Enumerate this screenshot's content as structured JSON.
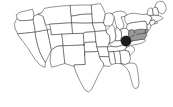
{
  "figure": {
    "background_color": "#ffffff",
    "width": 173,
    "height": 107
  },
  "map": {
    "name": "contiguous-united-states",
    "projection_style": "simplified outline",
    "outline_color": "#3a3a3a",
    "state_fill_color": "#ffffff",
    "highlight_fill_color": "#9a9a9a",
    "marker_color": "#1c1c1c",
    "highlighted_states": [
      "West Virginia",
      "Virginia",
      "Maryland",
      "Delaware"
    ],
    "marker": {
      "name": "location-marker",
      "shape": "filled-circle",
      "region": "Ohio / West Virginia border",
      "x": 126,
      "y": 41,
      "radius": 5.2
    },
    "states": [
      {
        "code": "WA",
        "name": "Washington",
        "highlighted": false,
        "d": "M16.5,14.5 L20.0,12.2 L26.5,10.6 L32.5,9.2 L33.4,12.0 L34.0,15.8 L33.2,19.4 L31.0,20.2 L25.0,20.6 L19.2,20.6 L17.4,18.6 Z"
      },
      {
        "code": "OR",
        "name": "Oregon",
        "highlighted": false,
        "d": "M17.4,18.6 L19.2,20.6 L25.0,20.6 L31.0,20.2 L33.2,19.4 L34.6,27.5 L35.3,32.0 L25.2,33.2 L17.8,33.8 L15.2,29.0 L14.4,24.0 Z"
      },
      {
        "code": "CA",
        "name": "California",
        "highlighted": false,
        "d": "M17.8,33.8 L25.2,33.2 L35.3,32.0 L36.0,38.0 L37.6,45.0 L39.8,52.0 L42.8,58.0 L45.4,62.5 L45.0,67.5 L40.0,65.0 L35.5,60.0 L31.5,54.0 L27.5,47.5 L23.0,41.5 L19.8,37.5 Z"
      },
      {
        "code": "NV",
        "name": "Nevada",
        "highlighted": false,
        "d": "M35.3,32.0 L44.6,30.2 L47.5,29.8 L49.6,41.0 L51.4,50.0 L45.4,62.5 L42.8,58.0 L39.8,52.0 L37.6,45.0 L36.0,38.0 Z"
      },
      {
        "code": "ID",
        "name": "Idaho",
        "highlighted": false,
        "d": "M33.2,19.4 L34.0,15.8 L38.0,14.2 L41.6,13.0 L43.2,16.6 L44.6,21.0 L45.6,25.2 L47.5,29.8 L44.6,30.2 L35.3,32.0 L34.6,27.5 Z"
      },
      {
        "code": "MT",
        "name": "Montana",
        "highlighted": false,
        "d": "M38.0,14.2 L41.6,13.0 L44.2,8.4 L52.0,7.0 L62.0,6.0 L70.5,5.4 L71.4,16.2 L72.0,22.8 L61.0,23.4 L50.0,24.2 L45.6,25.2 L44.6,21.0 L43.2,16.6 Z"
      },
      {
        "code": "WY",
        "name": "Wyoming",
        "highlighted": false,
        "d": "M50.0,24.2 L61.0,23.4 L72.0,22.8 L72.8,33.6 L62.0,34.2 L51.2,34.8 L50.6,29.0 Z"
      },
      {
        "code": "UT",
        "name": "Utah",
        "highlighted": false,
        "d": "M47.5,29.8 L50.6,29.0 L51.2,34.8 L62.0,34.2 L62.6,40.0 L63.2,45.8 L57.0,46.2 L51.4,50.0 L49.6,41.0 Z"
      },
      {
        "code": "CO",
        "name": "Colorado",
        "highlighted": false,
        "d": "M62.0,34.2 L72.8,33.6 L83.6,33.2 L84.2,45.0 L73.6,45.4 L63.2,45.8 L62.6,40.0 Z"
      },
      {
        "code": "AZ",
        "name": "Arizona",
        "highlighted": false,
        "d": "M51.4,50.0 L57.0,46.2 L63.2,45.8 L64.0,55.0 L64.8,63.5 L57.0,65.8 L51.6,67.2 L50.2,62.0 Z"
      },
      {
        "code": "NM",
        "name": "New Mexico",
        "highlighted": false,
        "d": "M63.2,45.8 L73.6,45.4 L84.2,45.0 L84.8,56.0 L85.3,64.5 L76.5,64.8 L74.2,64.9 L74.2,66.5 L64.8,63.5 L64.0,55.0 Z"
      },
      {
        "code": "ND",
        "name": "North Dakota",
        "highlighted": false,
        "d": "M70.5,5.4 L81.0,5.0 L91.5,5.0 L92.0,14.0 L81.6,14.4 L71.4,16.2 Z"
      },
      {
        "code": "SD",
        "name": "South Dakota",
        "highlighted": false,
        "d": "M71.4,16.2 L81.6,14.4 L92.0,14.0 L92.6,23.0 L82.4,23.2 L72.0,22.8 Z"
      },
      {
        "code": "NE",
        "name": "Nebraska",
        "highlighted": false,
        "d": "M72.0,22.8 L82.4,23.2 L92.6,23.0 L93.8,28.0 L95.2,31.6 L84.6,32.4 L83.6,33.2 L72.8,33.6 Z"
      },
      {
        "code": "KS",
        "name": "Kansas",
        "highlighted": false,
        "d": "M83.6,33.2 L84.6,32.4 L95.2,31.6 L96.0,42.0 L85.0,42.4 L84.2,45.0 Z"
      },
      {
        "code": "OK",
        "name": "Oklahoma",
        "highlighted": false,
        "d": "M84.2,45.0 L85.0,42.4 L96.0,42.0 L97.0,47.0 L98.2,51.5 L88.0,52.0 L84.8,51.8 L84.8,56.0 L84.2,45.0 Z"
      },
      {
        "code": "TX",
        "name": "Texas",
        "highlighted": false,
        "d": "M74.2,66.5 L74.2,64.9 L76.5,64.8 L85.3,64.5 L84.8,56.0 L84.8,51.8 L88.0,52.0 L98.2,51.5 L99.6,56.5 L101.0,60.0 L103.2,62.5 L104.0,66.0 L102.0,68.5 L100.0,72.0 L97.0,78.0 L94.0,84.5 L91.5,89.5 L88.5,92.0 L85.0,90.0 L82.0,85.0 L79.0,79.0 L76.2,72.5 Z"
      },
      {
        "code": "MN",
        "name": "Minnesota",
        "highlighted": false,
        "d": "M91.5,5.0 L96.0,4.2 L100.5,3.6 L102.5,7.0 L104.0,10.5 L105.4,14.0 L104.4,18.8 L103.6,22.6 L93.2,23.0 L92.6,23.0 L92.0,14.0 Z"
      },
      {
        "code": "IA",
        "name": "Iowa",
        "highlighted": false,
        "d": "M92.6,23.0 L93.2,23.0 L103.6,22.6 L105.4,26.0 L106.2,30.6 L96.2,31.4 L95.2,31.6 L93.8,28.0 Z"
      },
      {
        "code": "MO",
        "name": "Missouri",
        "highlighted": false,
        "d": "M95.2,31.6 L96.2,31.4 L106.2,30.6 L107.2,33.6 L109.6,35.4 L110.2,40.0 L109.0,43.6 L107.6,46.8 L97.0,47.0 L96.0,42.0 Z"
      },
      {
        "code": "AR",
        "name": "Arkansas",
        "highlighted": false,
        "d": "M97.0,47.0 L107.6,46.8 L108.6,52.0 L109.2,56.8 L99.6,56.5 L98.2,51.5 Z"
      },
      {
        "code": "LA",
        "name": "Louisiana",
        "highlighted": false,
        "d": "M99.6,56.5 L109.2,56.8 L110.0,62.0 L111.6,64.5 L109.0,66.5 L106.0,66.0 L104.0,66.0 L103.2,62.5 L101.0,60.0 Z"
      },
      {
        "code": "WI",
        "name": "Wisconsin",
        "highlighted": false,
        "d": "M103.6,22.6 L104.4,18.8 L105.4,14.0 L108.6,12.8 L112.0,13.6 L114.2,16.8 L113.6,21.0 L112.4,24.4 L110.6,25.8 L105.4,26.0 Z"
      },
      {
        "code": "IL",
        "name": "Illinois",
        "highlighted": false,
        "d": "M106.2,30.6 L110.6,25.8 L112.4,24.4 L114.0,27.0 L115.2,31.5 L116.0,36.5 L115.2,40.5 L112.4,42.5 L109.0,43.6 L110.2,40.0 L109.6,35.4 L107.2,33.6 Z"
      },
      {
        "code": "MI",
        "name": "Michigan",
        "highlighted": false,
        "d": "M112.0,13.6 L116.0,11.6 L121.0,11.0 L125.0,12.2 L127.0,15.0 L124.8,16.4 L121.0,17.0 L122.6,21.0 L124.0,25.2 L123.0,28.6 L119.6,29.6 L116.6,27.0 L115.4,23.0 L114.2,16.8 Z"
      },
      {
        "code": "IN",
        "name": "Indiana",
        "highlighted": false,
        "d": "M115.2,31.5 L116.6,27.0 L119.6,29.6 L121.2,31.0 L121.6,36.0 L121.0,40.5 L116.0,41.0 L115.2,40.5 L116.0,36.5 Z"
      },
      {
        "code": "OH",
        "name": "Ohio",
        "highlighted": false,
        "d": "M119.6,29.6 L123.0,28.6 L126.6,28.0 L129.0,30.6 L128.6,35.0 L127.0,38.6 L124.4,40.8 L121.0,40.5 L121.6,36.0 L121.2,31.0 Z"
      },
      {
        "code": "KY",
        "name": "Kentucky",
        "highlighted": false,
        "d": "M112.4,42.5 L115.2,40.5 L116.0,41.0 L121.0,40.5 L124.4,40.8 L126.2,43.0 L124.0,44.6 L120.0,46.0 L115.6,47.0 L112.0,46.4 L109.0,43.6 Z"
      },
      {
        "code": "TN",
        "name": "Tennessee",
        "highlighted": false,
        "d": "M107.6,46.8 L112.0,46.4 L115.6,47.0 L120.0,46.0 L124.0,44.6 L126.6,47.0 L125.0,50.0 L120.0,51.0 L114.0,51.6 L108.6,52.0 Z"
      },
      {
        "code": "MS",
        "name": "Mississippi",
        "highlighted": false,
        "d": "M109.2,56.8 L108.6,52.0 L114.0,51.6 L115.0,58.0 L115.6,63.5 L111.6,64.5 L110.0,62.0 Z"
      },
      {
        "code": "AL",
        "name": "Alabama",
        "highlighted": false,
        "d": "M114.0,51.6 L120.0,51.0 L120.6,57.0 L121.2,63.6 L115.6,63.5 L115.0,58.0 Z"
      },
      {
        "code": "GA",
        "name": "Georgia",
        "highlighted": false,
        "d": "M120.0,51.0 L125.0,50.0 L129.0,51.6 L130.0,55.5 L130.4,60.0 L128.6,63.2 L125.0,64.6 L121.2,63.6 L120.6,57.0 Z"
      },
      {
        "code": "FL",
        "name": "Florida",
        "highlighted": false,
        "d": "M121.2,63.6 L125.0,64.6 L128.6,63.2 L132.0,63.0 L135.6,64.0 L137.0,67.0 L137.8,72.0 L138.6,78.0 L139.0,84.0 L137.6,88.0 L134.6,88.5 L132.6,85.0 L131.0,79.0 L129.4,73.0 L127.0,68.5 L124.0,66.0 Z"
      },
      {
        "code": "SC",
        "name": "South Carolina",
        "highlighted": false,
        "d": "M125.0,50.0 L126.6,47.0 L130.6,45.4 L134.0,47.6 L134.6,50.6 L132.0,53.4 L130.0,55.5 L129.0,51.6 Z"
      },
      {
        "code": "NC",
        "name": "North Carolina",
        "highlighted": false,
        "d": "M126.6,47.0 L126.2,43.0 L130.0,41.4 L135.0,40.4 L140.0,39.6 L144.6,39.0 L145.4,41.0 L142.0,43.0 L137.0,44.4 L133.0,45.0 L130.6,45.4 Z"
      },
      {
        "code": "VA",
        "name": "Virginia",
        "highlighted": true,
        "d": "M126.2,43.0 L124.4,40.8 L127.0,38.6 L130.0,37.0 L134.0,35.4 L138.6,34.0 L143.0,33.2 L146.0,33.0 L147.0,35.0 L144.6,39.0 L140.0,39.6 L135.0,40.4 L130.0,41.4 Z"
      },
      {
        "code": "WV",
        "name": "West Virginia",
        "highlighted": true,
        "d": "M127.0,38.6 L128.6,35.0 L129.0,30.6 L131.6,29.4 L134.2,30.4 L135.0,33.0 L134.0,35.4 L130.0,37.0 Z"
      },
      {
        "code": "MD",
        "name": "Maryland",
        "highlighted": true,
        "d": "M135.0,33.0 L134.2,30.4 L138.0,29.4 L142.0,29.2 L145.4,29.6 L146.0,33.0 L143.0,33.2 L138.6,34.0 Z"
      },
      {
        "code": "DE",
        "name": "Delaware",
        "highlighted": true,
        "d": "M145.4,29.6 L147.2,28.4 L148.4,30.2 L147.4,32.6 L146.0,33.0 Z"
      },
      {
        "code": "PA",
        "name": "Pennsylvania",
        "highlighted": false,
        "d": "M126.6,28.0 L127.2,24.2 L131.0,22.8 L136.0,22.0 L141.0,21.4 L145.4,21.0 L147.2,24.6 L147.2,28.4 L145.4,29.6 L142.0,29.2 L138.0,29.4 L134.2,30.4 L131.6,29.4 L129.0,30.6 Z"
      },
      {
        "code": "NJ",
        "name": "New Jersey",
        "highlighted": false,
        "d": "M147.2,24.6 L149.6,23.4 L151.0,25.6 L150.4,28.4 L148.4,30.2 L147.2,28.4 Z"
      },
      {
        "code": "NY",
        "name": "New York",
        "highlighted": false,
        "d": "M127.0,15.0 L130.0,13.6 L134.6,13.2 L139.0,14.0 L143.4,14.6 L147.0,14.0 L150.0,15.6 L152.0,18.0 L150.6,20.6 L149.6,23.4 L147.2,24.6 L145.4,21.0 L141.0,21.4 L136.0,22.0 L131.0,22.8 L127.2,24.2 L124.8,21.0 L124.8,16.4 Z"
      },
      {
        "code": "CT",
        "name": "Connecticut",
        "highlighted": false,
        "d": "M150.6,20.6 L154.0,19.6 L155.4,21.6 L154.6,23.6 L151.0,25.6 L149.6,23.4 Z"
      },
      {
        "code": "RI",
        "name": "Rhode Island",
        "highlighted": false,
        "d": "M154.6,23.6 L155.4,21.6 L157.0,21.4 L157.2,23.0 Z"
      },
      {
        "code": "MA",
        "name": "Massachusetts",
        "highlighted": false,
        "d": "M150.0,15.6 L153.6,15.0 L158.0,15.4 L161.4,16.6 L163.2,18.4 L161.0,19.6 L157.0,21.4 L155.4,21.6 L154.0,19.6 L150.6,20.6 L152.0,18.0 Z"
      },
      {
        "code": "VT",
        "name": "Vermont",
        "highlighted": false,
        "d": "M147.0,14.0 L148.0,9.6 L150.2,7.8 L152.6,8.8 L153.0,12.6 L153.6,15.0 L150.0,15.6 Z"
      },
      {
        "code": "NH",
        "name": "New Hampshire",
        "highlighted": false,
        "d": "M153.0,12.6 L152.6,8.8 L155.0,6.8 L157.4,8.2 L158.6,12.0 L158.0,15.4 L153.6,15.0 Z"
      },
      {
        "code": "ME",
        "name": "Maine",
        "highlighted": false,
        "d": "M155.0,6.8 L156.4,3.0 L159.6,1.2 L163.4,2.0 L165.6,5.0 L166.2,9.0 L164.8,12.4 L162.0,14.2 L158.6,12.0 L157.4,8.2 Z"
      }
    ]
  },
  "accessible_description": "Outline map of the contiguous United States with four mid-Atlantic states shaded gray and a solid dark circular marker placed at the Ohio and West Virginia border."
}
